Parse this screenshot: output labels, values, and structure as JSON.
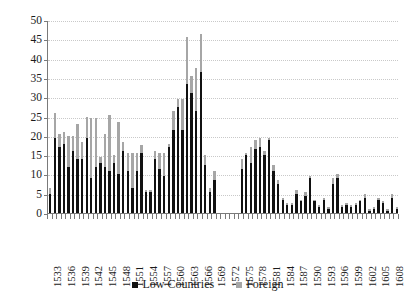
{
  "chart_data": {
    "type": "bar",
    "stacked": true,
    "title": "",
    "subtitle": "",
    "xlabel": "",
    "ylabel": "",
    "ylim": [
      0,
      50
    ],
    "ytick_labels": [
      "0",
      "5",
      "10",
      "15",
      "20",
      "25",
      "30",
      "35",
      "40",
      "45",
      "50"
    ],
    "ytick_values": [
      0,
      5,
      10,
      15,
      20,
      25,
      30,
      35,
      40,
      45,
      50
    ],
    "grid": true,
    "grid_style": "dotted-horizontal",
    "legend_position": "bottom-center",
    "legend": [
      "Low Countries",
      "Foreign"
    ],
    "colors": {
      "low_countries": "#111111",
      "foreign": "#a6a6a6",
      "grid": "#c9c9c9",
      "axis": "#7a7a7a"
    },
    "categories": [
      "1533",
      "1534",
      "1535",
      "1536",
      "1537",
      "1538",
      "1539",
      "1540",
      "1541",
      "1542",
      "1543",
      "1544",
      "1545",
      "1546",
      "1547",
      "1548",
      "1549",
      "1550",
      "1551",
      "1552",
      "1553",
      "1554",
      "1555",
      "1556",
      "1557",
      "1558",
      "1559",
      "1560",
      "1561",
      "1562",
      "1563",
      "1564",
      "1565",
      "1566",
      "1567",
      "1568",
      "1569",
      "1570",
      "1571",
      "1572",
      "1573",
      "1574",
      "1575",
      "1576",
      "1577",
      "1578",
      "1579",
      "1580",
      "1581",
      "1582",
      "1583",
      "1584",
      "1585",
      "1586",
      "1587",
      "1588",
      "1589",
      "1590",
      "1591",
      "1592",
      "1593",
      "1594",
      "1595",
      "1596",
      "1597",
      "1598",
      "1599",
      "1600",
      "1601",
      "1602",
      "1603",
      "1604",
      "1605",
      "1606",
      "1607",
      "1608",
      "1609"
    ],
    "tick_label_interval": 3,
    "tick_labels_shown": [
      "1533",
      "1536",
      "1539",
      "1542",
      "1545",
      "1548",
      "1551",
      "1554",
      "1557",
      "1560",
      "1563",
      "1566",
      "1569",
      "1572",
      "1575",
      "1578",
      "1581",
      "1584",
      "1587",
      "1590",
      "1593",
      "1596",
      "1599",
      "1602",
      "1605",
      "1608"
    ],
    "series": [
      {
        "name": "Low Countries",
        "color": "#111111",
        "values": [
          5,
          19.5,
          17,
          18,
          12,
          16,
          14,
          14,
          19.5,
          9,
          12,
          13,
          12,
          11,
          13,
          10,
          16,
          11,
          6.5,
          11,
          15.5,
          5.5,
          5.5,
          14,
          11.5,
          9.5,
          17,
          21.5,
          27.5,
          21.5,
          33.5,
          31,
          26.5,
          36.5,
          12.5,
          5.5,
          8.5,
          0,
          0,
          0,
          0,
          0,
          11.5,
          15,
          13,
          16.5,
          17,
          15,
          19,
          11,
          7.5,
          3.5,
          2,
          2,
          5,
          3,
          4.5,
          9,
          3,
          1.5,
          3.5,
          1,
          7.5,
          9,
          1.5,
          2,
          1.5,
          2,
          3,
          4,
          0.5,
          1,
          3.5,
          2.5,
          0.5,
          4,
          1
        ]
      },
      {
        "name": "Foreign",
        "color": "#a6a6a6",
        "values": [
          1.5,
          6.5,
          3.5,
          3,
          8,
          4,
          9,
          4.5,
          5.5,
          15.5,
          12.5,
          1.5,
          8.5,
          14.5,
          2,
          13.5,
          2.5,
          4.5,
          9,
          4.5,
          2,
          0.5,
          0.5,
          2,
          4,
          6,
          1,
          5,
          2,
          8,
          12,
          4.5,
          11,
          10,
          2.5,
          1,
          2.5,
          0,
          0,
          0,
          0,
          0,
          2.5,
          0.5,
          4,
          2.5,
          2.5,
          1,
          0.5,
          1.5,
          1,
          0.5,
          0.5,
          0.5,
          1,
          0.5,
          1,
          0.5,
          0.5,
          0.5,
          0.5,
          0.5,
          1.5,
          1,
          0.5,
          0.5,
          0.5,
          0.5,
          0.5,
          1,
          0.5,
          0.5,
          0.5,
          0.5,
          0.5,
          1,
          0.5
        ]
      }
    ]
  },
  "legend": {
    "items": [
      {
        "label": "Low Countries",
        "color": "#111111"
      },
      {
        "label": "Foreign",
        "color": "#a6a6a6"
      }
    ]
  }
}
